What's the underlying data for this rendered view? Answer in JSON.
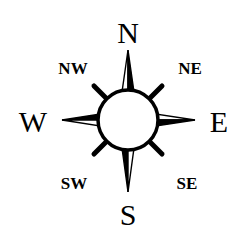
{
  "compass": {
    "labels": {
      "north": "N",
      "south": "S",
      "east": "E",
      "west": "W",
      "northeast": "NE",
      "northwest": "NW",
      "southeast": "SE",
      "southwest": "SW"
    },
    "colors": {
      "ink": "#000000",
      "background": "#ffffff"
    }
  }
}
